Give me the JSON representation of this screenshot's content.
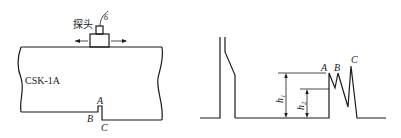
{
  "left_diagram": {
    "block_label": "CSK-1A",
    "probe_label": "探头",
    "cable_label": "6",
    "notch_labels": {
      "a": "A",
      "b": "B",
      "c": "C"
    }
  },
  "right_diagram": {
    "echo_labels": {
      "a": "A",
      "b": "B",
      "c": "C"
    },
    "height_labels": {
      "h1": "h",
      "h1_sub": "1",
      "h2": "h",
      "h2_sub": "2"
    }
  },
  "colors": {
    "stroke": "#1a1a1a",
    "background": "#ffffff"
  }
}
